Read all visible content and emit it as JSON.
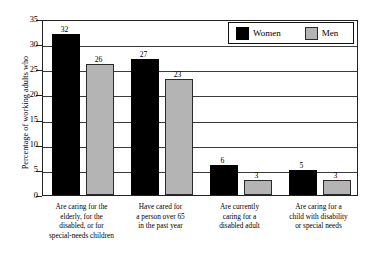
{
  "chart_data": {
    "type": "bar",
    "title": "",
    "subtitle": "",
    "xlabel": "",
    "ylabel": "Percentage of working adults who",
    "ylim": [
      0,
      35
    ],
    "yticks": [
      0,
      5,
      10,
      15,
      20,
      25,
      30,
      35
    ],
    "ytick_labels": [
      "0",
      "5",
      "10",
      "15",
      "20",
      "25",
      "30",
      "35"
    ],
    "grid": true,
    "grid_axis": "y",
    "legend_position": "top-right",
    "categories": [
      "Are caring for the elderly, for the disabled, or for special-needs children",
      "Have cared for a person over 65 in the past year",
      "Are currently caring for a disabled adult",
      "Are caring for a child with disability or special needs"
    ],
    "category_lines": [
      [
        "Are caring for the",
        "elderly, for the",
        "disabled, or for",
        "special-needs children"
      ],
      [
        "Have cared for",
        "a person over 65",
        "in the past year"
      ],
      [
        "Are currently",
        "caring for a",
        "disabled adult"
      ],
      [
        "Are caring for a",
        "child with disability",
        "or special needs"
      ]
    ],
    "series": [
      {
        "name": "Women",
        "color": "#000000",
        "values": [
          32,
          27,
          6,
          5
        ]
      },
      {
        "name": "Men",
        "color": "#b4b4b4",
        "values": [
          26,
          23,
          3,
          3
        ]
      }
    ],
    "value_labels": {
      "women": [
        "32",
        "27",
        "6",
        "5"
      ],
      "men": [
        "26",
        "23",
        "3",
        "3"
      ]
    }
  },
  "legend": {
    "entries": [
      {
        "label": "Women",
        "swatch": "black-square-swatch"
      },
      {
        "label": "Men",
        "swatch": "gray-square-swatch"
      }
    ]
  }
}
